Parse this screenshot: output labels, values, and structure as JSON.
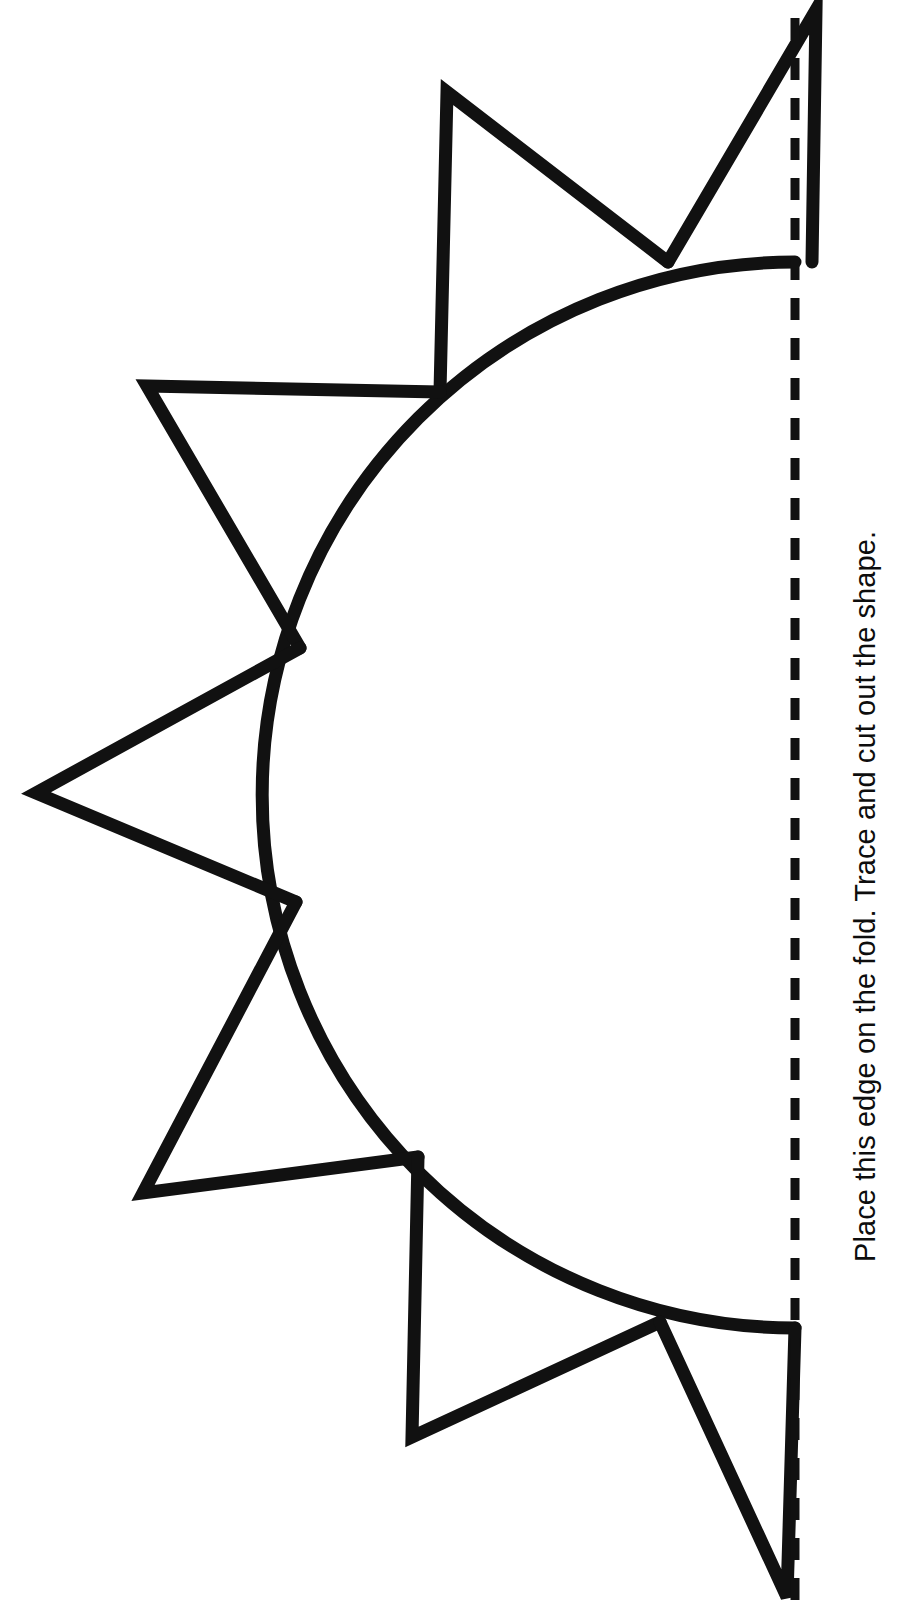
{
  "document": {
    "kind": "printable-craft-template",
    "title_visible": false,
    "background_color": "#ffffff",
    "ink_color": "#111111"
  },
  "caption": {
    "text": "Place this edge on the fold.  Trace and cut out the shape.",
    "sentences": [
      "Place this edge on the fold.",
      "Trace and cut out the shape."
    ],
    "orientation": "rotated-90-ccw",
    "color": "#0d0d0d"
  },
  "fold_line": {
    "name": "fold-line",
    "style": "dashed",
    "orientation": "vertical",
    "x": 795,
    "y_start": 18,
    "y_end": 1600,
    "dash_length": 22,
    "gap_length": 18,
    "stroke_width": 9,
    "color": "#111111"
  },
  "shape": {
    "name": "half-sun",
    "stroke_width": 13,
    "stroke_color": "#111111",
    "fill": "none",
    "circle": {
      "center_x": 795,
      "center_y": 795,
      "radius": 533,
      "arc_start_deg": 90,
      "arc_end_deg": 270,
      "description": "left half of a circle; flat side lies on the fold line"
    },
    "rays": [
      {
        "id": "ray-1",
        "label": "top-fold-ray",
        "apex_x": 816,
        "apex_y": 10,
        "base_a_x": 812,
        "base_a_y": 262,
        "base_b_x": 668,
        "base_b_y": 262
      },
      {
        "id": "ray-2",
        "label": "upper-ray",
        "apex_x": 447,
        "apex_y": 92,
        "base_a_x": 668,
        "base_a_y": 262,
        "base_b_x": 440,
        "base_b_y": 392
      },
      {
        "id": "ray-3",
        "label": "upper-left-ray",
        "apex_x": 147,
        "apex_y": 386,
        "base_a_x": 440,
        "base_a_y": 392,
        "base_b_x": 300,
        "base_b_y": 648
      },
      {
        "id": "ray-4",
        "label": "left-ray",
        "apex_x": 36,
        "apex_y": 793,
        "base_a_x": 300,
        "base_a_y": 648,
        "base_b_x": 296,
        "base_b_y": 902
      },
      {
        "id": "ray-5",
        "label": "lower-left-ray",
        "apex_x": 143,
        "apex_y": 1193,
        "base_a_x": 296,
        "base_a_y": 902,
        "base_b_x": 418,
        "base_b_y": 1157
      },
      {
        "id": "ray-6",
        "label": "lower-ray",
        "apex_x": 412,
        "apex_y": 1437,
        "base_a_x": 418,
        "base_a_y": 1157,
        "base_b_x": 660,
        "base_b_y": 1322
      },
      {
        "id": "ray-7",
        "label": "bottom-fold-ray",
        "apex_x": 787,
        "apex_y": 1597,
        "base_a_x": 660,
        "base_a_y": 1322,
        "base_b_x": 795,
        "base_b_y": 1328
      }
    ],
    "ray_count": 7
  }
}
